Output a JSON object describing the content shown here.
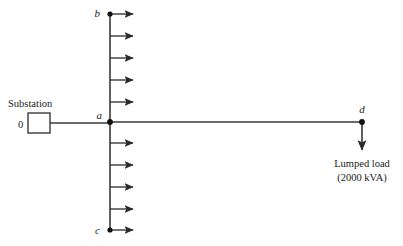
{
  "diagram": {
    "type": "one-line-feeder-diagram",
    "canvas": {
      "width": 403,
      "height": 246,
      "background": "#ffffff"
    },
    "colors": {
      "wire": "#3a3a3a",
      "arrow": "#2b2b2b",
      "text": "#1a1a1a",
      "node": "#111111",
      "background": "#ffffff"
    }
  },
  "substation": {
    "caption": "Substation",
    "node_label": "0",
    "box": {
      "x": 28,
      "y": 113,
      "width": 22,
      "height": 20
    },
    "caption_pos": {
      "x": 8,
      "y": 107
    },
    "node_label_pos": {
      "x": 18,
      "y": 127
    }
  },
  "nodes": [
    {
      "id": "a",
      "label": "a",
      "x": 110,
      "y": 122,
      "label_x": 96,
      "label_y": 119,
      "dot": true
    },
    {
      "id": "b",
      "label": "b",
      "x": 110,
      "y": 14,
      "label_x": 96,
      "label_y": 14,
      "dot": true
    },
    {
      "id": "c",
      "label": "c",
      "x": 110,
      "y": 230,
      "label_x": 96,
      "label_y": 233,
      "dot": true
    },
    {
      "id": "d",
      "label": "d",
      "x": 362,
      "y": 122,
      "label_x": 357,
      "label_y": 112,
      "dot": true
    }
  ],
  "lines": [
    {
      "name": "substation-to-a",
      "x1": 50,
      "y1": 123,
      "x2": 110,
      "y2": 123
    },
    {
      "name": "a-to-d",
      "x1": 110,
      "y1": 122,
      "x2": 362,
      "y2": 122
    },
    {
      "name": "b-to-c-feeder",
      "x1": 110,
      "y1": 14,
      "x2": 110,
      "y2": 230
    }
  ],
  "distributed_loads": {
    "description": "Uniformly distributed lateral load taps along feeder b-c",
    "count": 10,
    "arrow_length": 28,
    "start_x": 110,
    "y_positions": [
      14,
      36,
      58,
      80,
      102,
      143,
      165,
      187,
      209,
      230
    ]
  },
  "lumped_load": {
    "label_line1": "Lumped load",
    "label_line2": "(2000 kVA)",
    "value": 2000,
    "unit": "kVA",
    "arrow": {
      "x": 362,
      "y1": 122,
      "y2": 154
    },
    "label_pos": {
      "x": 362,
      "y1": 166,
      "y2": 180
    }
  }
}
